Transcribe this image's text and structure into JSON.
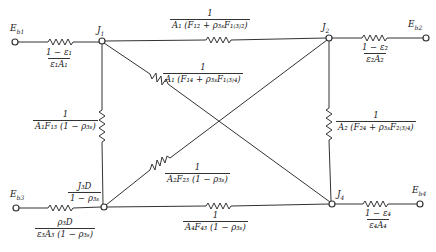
{
  "diagram": {
    "type": "radiation-network",
    "nodes": {
      "Eb1": {
        "label": "E_b1",
        "text": "E",
        "sub": "b1"
      },
      "Eb2": {
        "label": "E_b2",
        "text": "E",
        "sub": "b2"
      },
      "Eb3": {
        "label": "E_b3",
        "text": "E",
        "sub": "b3"
      },
      "Eb4": {
        "label": "E_b4",
        "text": "E",
        "sub": "b4"
      },
      "J1": {
        "text": "J",
        "sub": "1"
      },
      "J2": {
        "text": "J",
        "sub": "2"
      },
      "J4": {
        "text": "J",
        "sub": "4"
      }
    },
    "resistances": {
      "r_eb1_j1": {
        "num": "1 − ε₁",
        "den": "ε₁A₁"
      },
      "r_j2_eb2": {
        "num": "1 − ε₂",
        "den": "ε₂A₂"
      },
      "r_j4_eb4": {
        "num": "1 − ε₄",
        "den": "ε₄A₄"
      },
      "r_eb3_j3_top": {
        "num": "J₃D",
        "den": "1 − ρ₃ₛ"
      },
      "r_eb3_j3_bottom": {
        "num": "ρ₃D",
        "den": "ε₃A₃ (1 − ρ₃ₛ)"
      },
      "r_j1_j2": {
        "num": "1",
        "den": "A₁ (F₁₂ + ρ₃ₛF₁₍₃₎₂)"
      },
      "r_j1_j4": {
        "num": "1",
        "den": "A₁ (F₁₄ + ρ₃ₛF₁₍₃₎₄)"
      },
      "r_j1_j3": {
        "num": "1",
        "den": "A₁F₁₃ (1 − ρ₃ₛ)"
      },
      "r_j2_j3": {
        "num": "1",
        "den": "A₂F₂₃ (1 − ρ₃ₛ)"
      },
      "r_j2_j4": {
        "num": "1",
        "den": "A₂ (F₂₄ + ρ₃ₛF₂₍₃₎₄)"
      },
      "r_j3_j4": {
        "num": "1",
        "den": "A₄F₄₃ (1 − ρ₃ₛ)"
      }
    }
  }
}
